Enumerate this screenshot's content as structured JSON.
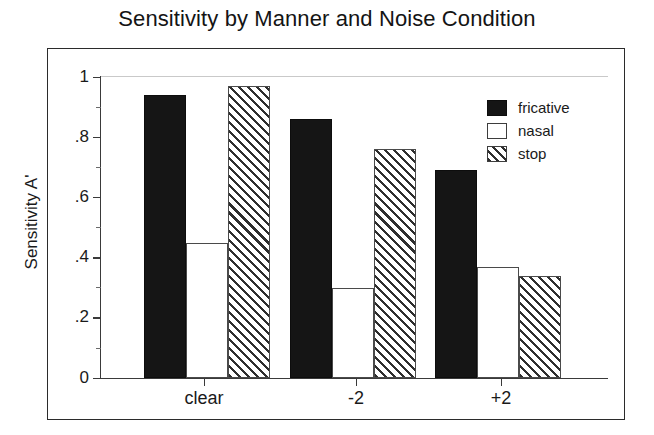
{
  "chart_data": {
    "type": "bar",
    "title": "Sensitivity by Manner and Noise Condition",
    "xlabel": "",
    "ylabel": "Sensitivity A'",
    "categories": [
      "clear",
      "-2",
      "+2"
    ],
    "series": [
      {
        "name": "fricative",
        "values": [
          0.94,
          0.86,
          0.69
        ],
        "fill": "solid-black",
        "color": "#151515"
      },
      {
        "name": "nasal",
        "values": [
          0.45,
          0.3,
          0.37
        ],
        "fill": "white",
        "color": "#ffffff"
      },
      {
        "name": "stop",
        "values": [
          0.97,
          0.76,
          0.34
        ],
        "fill": "diagonal-hatch",
        "color": "#2e2e2e"
      }
    ],
    "ylim": [
      0,
      1
    ],
    "y_ticks": [
      "0",
      ".2",
      ".4",
      ".6",
      ".8",
      "1"
    ],
    "y_tick_values": [
      0,
      0.2,
      0.4,
      0.6,
      0.8,
      1
    ],
    "grid": false,
    "legend_position": "top-right",
    "frame": true
  },
  "legend": {
    "entries": [
      {
        "label": "fricative"
      },
      {
        "label": "nasal"
      },
      {
        "label": "stop"
      }
    ]
  },
  "axis": {
    "y_title": "Sensitivity A'",
    "y_labels": [
      "1",
      ".8",
      ".6",
      ".4",
      ".2",
      "0"
    ],
    "x_labels": [
      "clear",
      "-2",
      "+2"
    ]
  },
  "title": "Sensitivity by Manner and Noise Condition"
}
